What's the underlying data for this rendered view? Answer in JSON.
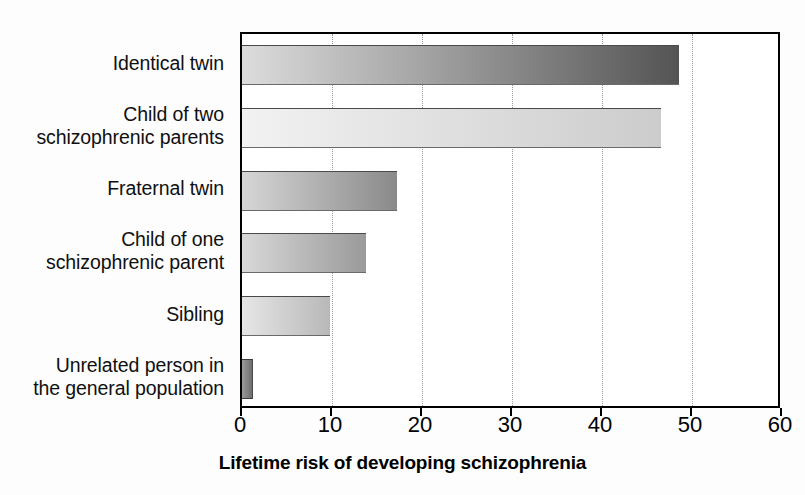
{
  "chart_data": {
    "type": "bar",
    "orientation": "horizontal",
    "title": "",
    "xlabel": "Lifetime risk of developing schizophrenia",
    "ylabel": "",
    "xlim": [
      0,
      60
    ],
    "xticks": [
      0,
      10,
      20,
      30,
      40,
      50,
      60
    ],
    "xtick_labels": [
      "0",
      "10",
      "20",
      "30",
      "40",
      "50",
      "60"
    ],
    "grid": "vertical dotted gridlines at each x tick",
    "legend": "none",
    "categories": [
      "Identical twin",
      "Child of two\nschizophrenic parents",
      "Fraternal twin",
      "Child of one\nschizophrenic parent",
      "Sibling",
      "Unrelated person in\nthe general population"
    ],
    "values": [
      48.5,
      46.5,
      17.2,
      13.8,
      9.8,
      1.2
    ],
    "bar_styles": [
      {
        "from": "#dcdcdc",
        "to": "#545454"
      },
      {
        "from": "#f2f2f2",
        "to": "#cccccc"
      },
      {
        "from": "#d6d6d6",
        "to": "#8a8a8a"
      },
      {
        "from": "#d8d8d8",
        "to": "#9a9a9a"
      },
      {
        "from": "#e6e6e6",
        "to": "#b8b8b8"
      },
      {
        "from": "#9a9a9a",
        "to": "#6e6e6e"
      }
    ]
  },
  "colors": {
    "axis": "#000000",
    "gridline": "#9a9a9a",
    "background": "#ffffff",
    "text": "#101010"
  }
}
